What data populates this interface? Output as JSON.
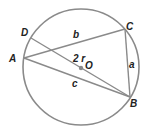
{
  "diagram": {
    "stroke_color": "#888888",
    "label_color": "#222222",
    "circle": {
      "cx": 81,
      "cy": 67,
      "r": 58
    },
    "center": {
      "label": "O",
      "x": 81,
      "y": 68
    },
    "points": {
      "A": {
        "label": "A",
        "x": 24,
        "y": 58
      },
      "B": {
        "label": "B",
        "x": 130,
        "y": 97
      },
      "C": {
        "label": "C",
        "x": 125,
        "y": 29
      },
      "D": {
        "label": "D",
        "x": 31,
        "y": 38
      }
    },
    "segments": [
      {
        "from": "A",
        "to": "C",
        "label": "b"
      },
      {
        "from": "A",
        "to": "B",
        "label": "c"
      },
      {
        "from": "C",
        "to": "B",
        "label": "a"
      },
      {
        "from": "D",
        "to": "B",
        "label": "2r"
      }
    ],
    "labels": {
      "A": "A",
      "B": "B",
      "C": "C",
      "D": "D",
      "O": "O",
      "a": "a",
      "b": "b",
      "c": "c",
      "diameter": "2 r"
    }
  }
}
